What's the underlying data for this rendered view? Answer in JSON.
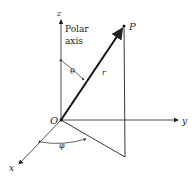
{
  "diagram": {
    "labels": {
      "z_axis": "z",
      "y_axis": "y",
      "x_axis": "x",
      "polar_axis_line1": "Polar",
      "polar_axis_line2": "axis",
      "point": "P",
      "origin": "O",
      "radius": "r",
      "theta": "θ",
      "phi": "φ"
    },
    "colors": {
      "ink": "#222222",
      "background": "#ffffff"
    }
  }
}
